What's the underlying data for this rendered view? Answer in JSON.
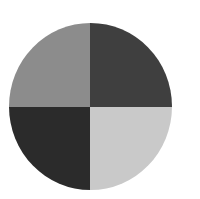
{
  "figure": {
    "shape": "circle",
    "quadrants": [
      {
        "position": "top-left",
        "color": "#8c8c8c"
      },
      {
        "position": "top-right",
        "color": "#3f3f3f"
      },
      {
        "position": "bottom-left",
        "color": "#2b2b2b"
      },
      {
        "position": "bottom-right",
        "color": "#c9c9c9"
      }
    ]
  }
}
